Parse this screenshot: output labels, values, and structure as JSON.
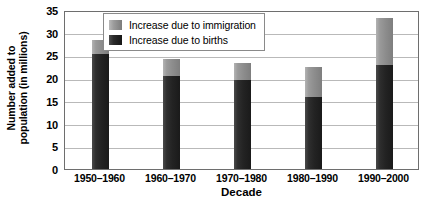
{
  "chart_data": {
    "type": "bar",
    "stacked": true,
    "title": "",
    "xlabel": "Decade",
    "ylabel": "Number added to population (in millions)",
    "ylabel_lines": [
      "Number added to",
      "population (in millions)"
    ],
    "categories": [
      "1950–1960",
      "1960–1970",
      "1970–1980",
      "1980–1990",
      "1990–2000"
    ],
    "series": [
      {
        "name": "Increase due to births",
        "color": "#242424",
        "values": [
          25.3,
          20.5,
          19.5,
          15.8,
          22.8
        ]
      },
      {
        "name": "Increase due to immigration",
        "color": "#909090",
        "values": [
          3.0,
          3.8,
          3.9,
          6.7,
          10.4
        ]
      }
    ],
    "totals": [
      28.3,
      24.3,
      23.4,
      22.5,
      33.2
    ],
    "ylim": [
      0,
      35
    ],
    "yticks": [
      0,
      5,
      10,
      15,
      20,
      25,
      30,
      35
    ],
    "ytick_labels": [
      "0",
      "5",
      "10",
      "15",
      "20",
      "25",
      "30",
      "35"
    ],
    "grid": true,
    "legend_position": "top-center"
  },
  "legend": {
    "items": [
      {
        "label": "Increase due to immigration",
        "swatch": "immigration-swatch"
      },
      {
        "label": "Increase due to births",
        "swatch": "births-swatch"
      }
    ]
  },
  "axes": {
    "x_title": "Decade",
    "y_title_line1": "Number added to",
    "y_title_line2": "population (in millions)"
  }
}
